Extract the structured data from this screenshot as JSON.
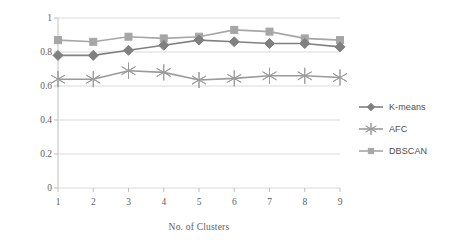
{
  "chart_data": {
    "type": "line",
    "title": "",
    "xlabel": "No. of Clusters",
    "ylabel": "F-measure",
    "categories": [
      "1",
      "2",
      "3",
      "4",
      "5",
      "6",
      "7",
      "8",
      "9"
    ],
    "x": [
      1,
      2,
      3,
      4,
      5,
      6,
      7,
      8,
      9
    ],
    "xlim": [
      1,
      9
    ],
    "ylim": [
      0,
      1
    ],
    "yticks": [
      "0",
      "0.2",
      "0.4",
      "0.6",
      "0.8",
      "1"
    ],
    "ytick_values": [
      0,
      0.2,
      0.4,
      0.6,
      0.8,
      1
    ],
    "grid": "horizontal",
    "legend_position": "right",
    "series": [
      {
        "name": "K-means",
        "marker": "diamond",
        "color": "#808080",
        "values": [
          0.78,
          0.78,
          0.81,
          0.84,
          0.87,
          0.86,
          0.85,
          0.85,
          0.83
        ]
      },
      {
        "name": "AFC",
        "marker": "asterisk",
        "color": "#9a9a9a",
        "values": [
          0.64,
          0.64,
          0.69,
          0.68,
          0.635,
          0.645,
          0.66,
          0.66,
          0.65
        ]
      },
      {
        "name": "DBSCAN",
        "marker": "square",
        "color": "#a6a6a6",
        "values": [
          0.87,
          0.86,
          0.89,
          0.88,
          0.89,
          0.93,
          0.92,
          0.88,
          0.87
        ]
      }
    ]
  },
  "axes": {
    "y_title": "F-measure",
    "x_title": "No. of Clusters"
  },
  "legend": {
    "entries": [
      {
        "label": "K-means",
        "marker": "diamond-marker-icon"
      },
      {
        "label": "AFC",
        "marker": "asterisk-marker-icon"
      },
      {
        "label": "DBSCAN",
        "marker": "square-marker-icon"
      }
    ]
  },
  "colors": {
    "grid": "#d9d9d9",
    "axis": "#bfbfbf",
    "kmeans": "#808080",
    "afc": "#9a9a9a",
    "dbscan": "#a6a6a6",
    "text": "#5e5e5e",
    "background": "#ffffff"
  }
}
